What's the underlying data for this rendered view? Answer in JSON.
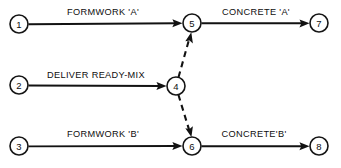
{
  "diagram": {
    "type": "activity-on-arrow-network",
    "title": "",
    "nodes": [
      {
        "id": "1",
        "label": "1",
        "cx": 19,
        "cy": 24,
        "r": 9
      },
      {
        "id": "2",
        "label": "2",
        "cx": 19,
        "cy": 85,
        "r": 9
      },
      {
        "id": "3",
        "label": "3",
        "cx": 19,
        "cy": 146,
        "r": 9
      },
      {
        "id": "4",
        "label": "4",
        "cx": 176,
        "cy": 86,
        "r": 9
      },
      {
        "id": "5",
        "label": "5",
        "cx": 192,
        "cy": 23,
        "r": 9
      },
      {
        "id": "6",
        "label": "6",
        "cx": 192,
        "cy": 146,
        "r": 9
      },
      {
        "id": "7",
        "label": "7",
        "cx": 319,
        "cy": 23,
        "r": 9
      },
      {
        "id": "8",
        "label": "8",
        "cx": 319,
        "cy": 146,
        "r": 9
      }
    ],
    "edges": [
      {
        "id": "e1-5",
        "from": "1",
        "to": "5",
        "label": "FORMWORK 'A'",
        "style": "solid",
        "label_x": 103,
        "label_y": 15
      },
      {
        "id": "e2-4",
        "from": "2",
        "to": "4",
        "label": "DELIVER READY-MIX",
        "style": "solid",
        "label_x": 96,
        "label_y": 78
      },
      {
        "id": "e3-6",
        "from": "3",
        "to": "6",
        "label": "FORMWORK 'B'",
        "style": "solid",
        "label_x": 103,
        "label_y": 137
      },
      {
        "id": "e5-7",
        "from": "5",
        "to": "7",
        "label": "CONCRETE 'A'",
        "style": "solid",
        "label_x": 256,
        "label_y": 15
      },
      {
        "id": "e6-8",
        "from": "6",
        "to": "8",
        "label": "CONCRETE'B'",
        "style": "solid",
        "label_x": 254,
        "label_y": 137
      },
      {
        "id": "e4-5",
        "from": "4",
        "to": "5",
        "label": "",
        "style": "dashed",
        "label_x": 0,
        "label_y": 0
      },
      {
        "id": "e4-6",
        "from": "4",
        "to": "6",
        "label": "",
        "style": "dashed",
        "label_x": 0,
        "label_y": 0
      }
    ],
    "colors": {
      "ink": "#121212",
      "background": "#ffffff"
    }
  }
}
